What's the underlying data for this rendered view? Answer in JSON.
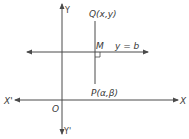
{
  "diagram": {
    "title": "",
    "labels": {
      "y_axis_top": "Y",
      "y_axis_bottom": "Y'",
      "x_axis_right": "X",
      "x_axis_left": "X'",
      "origin": "O",
      "point_q": "Q(x,y)",
      "point_m": "M",
      "line_label": "y = b",
      "point_p": "P(α,β)"
    },
    "colors": {
      "line": "#4a4a4a",
      "text": "#3a3a3a",
      "background": "#ffffff"
    }
  }
}
